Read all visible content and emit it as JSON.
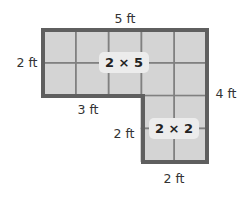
{
  "diagram": {
    "type": "composite-rectangle-area",
    "colors": {
      "tile_fill": "#d4d4d4",
      "grid_line": "#808080",
      "outline": "#5f5f5f",
      "label_bg": "#ececec",
      "text": "#333333"
    },
    "top_rect": {
      "rows": 2,
      "cols": 5,
      "area_label": "2 × 5"
    },
    "bottom_rect": {
      "rows": 2,
      "cols": 2,
      "area_label": "2 × 2"
    },
    "dimensions": {
      "top_width": "5 ft",
      "top_height": "2 ft",
      "right_height": "4 ft",
      "notch_width": "3 ft",
      "bottom_height": "2 ft",
      "bottom_width": "2 ft"
    }
  }
}
